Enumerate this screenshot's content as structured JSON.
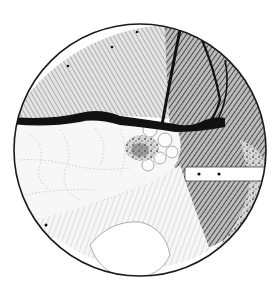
{
  "image": {
    "kind": "surgical pen-and-ink illustration",
    "frame": "circular endoscopic/laparoscopic view",
    "width": 280,
    "height": 292,
    "colors": {
      "background": "#ffffff",
      "ink": "#111111",
      "hatch_dark": "#3a3a3a",
      "hatch_mid": "#8a8a8a",
      "light_tissue": "#f4f4f4"
    },
    "regions": [
      {
        "name": "upper-hatched-tissue",
        "description": "cross-hatched organ surface across upper half"
      },
      {
        "name": "dark-vessel-band",
        "description": "thick black vessel running horizontally across middle"
      },
      {
        "name": "lobulated-gland",
        "description": "pale lobulated tissue on left with dotted outlines"
      },
      {
        "name": "dark-lesion",
        "description": "stippled dark nodule at center"
      },
      {
        "name": "right-dark-organ",
        "description": "densely hatched organ on right side with branching vessels"
      },
      {
        "name": "retractor-instrument",
        "description": "white bar instrument with two black dots entering from right"
      },
      {
        "name": "lower-pale-structure",
        "description": "smooth pale rounded structure at bottom"
      }
    ]
  }
}
